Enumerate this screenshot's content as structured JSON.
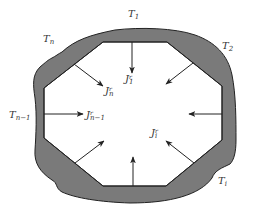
{
  "diagram": {
    "title": "",
    "colors": {
      "wall_fill": "#7a7a7a",
      "wall_stroke": "#222222",
      "arrow": "#222222",
      "background": "#ffffff",
      "label": "#333333"
    },
    "surface_labels": [
      {
        "id": "T1",
        "base": "T",
        "sub": "1"
      },
      {
        "id": "T2",
        "base": "T",
        "sub": "2"
      },
      {
        "id": "Ti",
        "base": "T",
        "sub": "i"
      },
      {
        "id": "Tn-1",
        "base": "T",
        "sub": "n−1"
      },
      {
        "id": "Tn",
        "base": "T",
        "sub": "n"
      }
    ],
    "flux_labels": [
      {
        "id": "J1r",
        "base": "J",
        "sup": "r",
        "sub": "1"
      },
      {
        "id": "Jnr",
        "base": "J",
        "sup": "r",
        "sub": "n"
      },
      {
        "id": "Jn-1r",
        "base": "J",
        "sup": "r",
        "sub": "n−1"
      },
      {
        "id": "Jir",
        "base": "J",
        "sup": "r",
        "sub": "i"
      }
    ],
    "arrows_count": 8
  }
}
